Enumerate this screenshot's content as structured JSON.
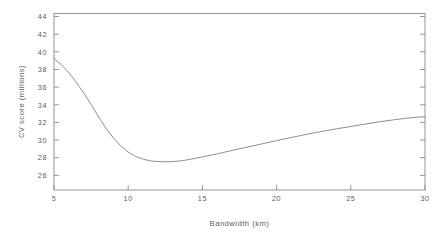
{
  "chart_data": {
    "type": "line",
    "title": "",
    "xlabel": "Bandwidth (km)",
    "ylabel": "CV score (millions)",
    "xlim": [
      5,
      30
    ],
    "ylim": [
      25.2,
      45.2
    ],
    "grid": false,
    "legend": null,
    "xticks": [
      5,
      10,
      15,
      20,
      25,
      30
    ],
    "xtick_labels": [
      "5",
      "10",
      "15",
      "20",
      "25",
      "30"
    ],
    "yticks": [
      26,
      28,
      30,
      32,
      34,
      36,
      38,
      40,
      42,
      44
    ],
    "ytick_labels": [
      "26",
      "28",
      "30",
      "32",
      "34",
      "36",
      "38",
      "40",
      "42",
      "44"
    ],
    "series": [
      {
        "name": "CV score",
        "color": "#808080",
        "x": [
          5.0,
          5.5,
          6.0,
          6.5,
          7.0,
          7.5,
          8.0,
          8.5,
          9.0,
          9.5,
          10.0,
          10.5,
          11.0,
          11.5,
          12.0,
          12.5,
          13.0,
          13.5,
          14.0,
          14.5,
          15.0,
          16.0,
          17.0,
          18.0,
          19.0,
          20.0,
          21.0,
          22.0,
          23.0,
          24.0,
          25.0,
          26.0,
          27.0,
          28.0,
          29.0,
          29.5,
          30.0
        ],
        "y": [
          40.1,
          39.4,
          38.5,
          37.4,
          36.2,
          34.9,
          33.5,
          32.2,
          31.1,
          30.2,
          29.5,
          29.0,
          28.7,
          28.5,
          28.42,
          28.4,
          28.42,
          28.5,
          28.62,
          28.78,
          28.95,
          29.3,
          29.68,
          30.05,
          30.42,
          30.8,
          31.15,
          31.5,
          31.82,
          32.12,
          32.4,
          32.68,
          32.95,
          33.18,
          33.38,
          33.45,
          33.5
        ]
      }
    ],
    "annotations": []
  },
  "axes": {
    "xtick_label_5": "5",
    "xtick_label_10": "10",
    "xtick_label_15": "15",
    "xtick_label_20": "20",
    "xtick_label_25": "25",
    "xtick_label_30": "30",
    "ytick_label_26": "26",
    "ytick_label_28": "28",
    "ytick_label_30": "30",
    "ytick_label_32": "32",
    "ytick_label_34": "34",
    "ytick_label_36": "36",
    "ytick_label_38": "38",
    "ytick_label_40": "40",
    "ytick_label_42": "42",
    "ytick_label_44": "44"
  },
  "style": {
    "axis_color": "#8a8a8a",
    "line_color": "#808080",
    "background": "#ffffff",
    "text_color": "#5a5a5a"
  }
}
